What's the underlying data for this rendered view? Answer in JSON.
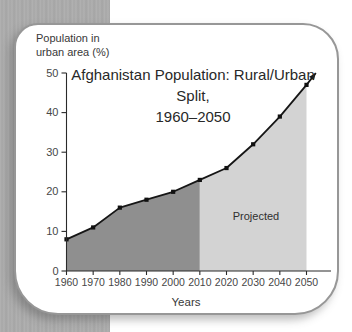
{
  "labels": {
    "y_axis_title_line1": "Population in",
    "y_axis_title_line2": "urban area (%)",
    "x_axis_title": "Years",
    "projected": "Projected"
  },
  "chart_data": {
    "type": "area",
    "title": "Afghanistan Population: Rural/Urban Split, 1960–2050",
    "title_lines": [
      "Afghanistan Population: Rural/Urban Split,",
      "1960–2050"
    ],
    "xlabel": "Years",
    "ylabel": "Population in urban area (%)",
    "x": [
      1960,
      1970,
      1980,
      1990,
      2000,
      2010,
      2020,
      2030,
      2040,
      2050
    ],
    "y": [
      8,
      11,
      16,
      18,
      20,
      23,
      26,
      32,
      39,
      47
    ],
    "x_ticks": [
      1960,
      1970,
      1980,
      1990,
      2000,
      2010,
      2020,
      2030,
      2040,
      2050
    ],
    "y_ticks": [
      0,
      10,
      20,
      30,
      40,
      50
    ],
    "xlim": [
      1960,
      2050
    ],
    "ylim": [
      0,
      50
    ],
    "grid": false,
    "legend": false,
    "regions": [
      {
        "name": "historical",
        "from": 1960,
        "to": 2010,
        "fill": "#8f8f8f"
      },
      {
        "name": "projected",
        "from": 2010,
        "to": 2050,
        "fill": "#d3d3d3",
        "label": "Projected"
      }
    ],
    "arrow_end": {
      "x": 2053.5,
      "y": 50
    },
    "line_color": "#161616",
    "marker": "square",
    "marker_color": "#111111",
    "axis_color": "#2a2a2a"
  }
}
